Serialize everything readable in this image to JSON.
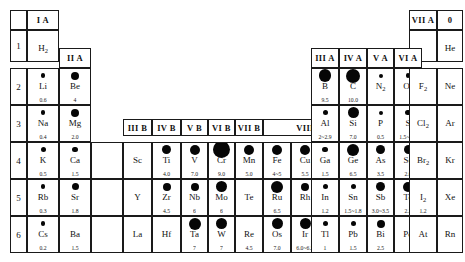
{
  "group_headers": [
    {
      "label": "I A",
      "x": 27,
      "y": 10,
      "w": 32,
      "h": 20
    },
    {
      "label": "II A",
      "x": 59,
      "y": 48,
      "w": 32,
      "h": 20
    },
    {
      "label": "III B",
      "x": 123,
      "y": 119,
      "w": 29,
      "h": 17
    },
    {
      "label": "IV B",
      "x": 152,
      "y": 119,
      "w": 29,
      "h": 17
    },
    {
      "label": "V B",
      "x": 181,
      "y": 119,
      "w": 27,
      "h": 17
    },
    {
      "label": "VI B",
      "x": 208,
      "y": 119,
      "w": 27,
      "h": 17
    },
    {
      "label": "VII B",
      "x": 235,
      "y": 119,
      "w": 28,
      "h": 17
    },
    {
      "label": "VIII",
      "x": 263,
      "y": 119,
      "w": 84,
      "h": 17
    },
    {
      "label": "I B",
      "x": 347,
      "y": 119,
      "w": 25,
      "h": 17
    },
    {
      "label": "II B",
      "x": 372,
      "y": 119,
      "w": 26,
      "h": 17
    },
    {
      "label": "III A",
      "x": 311,
      "y": 48,
      "w": 28,
      "h": 20
    },
    {
      "label": "IV A",
      "x": 339,
      "y": 48,
      "w": 28,
      "h": 20
    },
    {
      "label": "V A",
      "x": 367,
      "y": 48,
      "w": 27,
      "h": 20
    },
    {
      "label": "VI A",
      "x": 394,
      "y": 48,
      "w": 28,
      "h": 20
    },
    {
      "label": "VII A",
      "x": 409,
      "y": 10,
      "w": 28,
      "h": 20
    },
    {
      "label": "0",
      "x": 437,
      "y": 10,
      "w": 26,
      "h": 20
    }
  ],
  "period_labels": [
    {
      "label": "1",
      "x": 10,
      "y": 30,
      "w": 17,
      "h": 32
    },
    {
      "label": "2",
      "x": 10,
      "y": 68,
      "w": 17,
      "h": 37
    },
    {
      "label": "3",
      "x": 10,
      "y": 105,
      "w": 17,
      "h": 37
    },
    {
      "label": "4",
      "x": 10,
      "y": 142,
      "w": 17,
      "h": 37
    },
    {
      "label": "5",
      "x": 10,
      "y": 179,
      "w": 17,
      "h": 37
    },
    {
      "label": "6",
      "x": 10,
      "y": 216,
      "w": 17,
      "h": 37
    }
  ],
  "elements": [
    {
      "symbol": "H",
      "sub": "2",
      "value": "",
      "dot": 0,
      "x": 27,
      "y": 30,
      "w": 32,
      "h": 32
    },
    {
      "symbol": "He",
      "sub": "",
      "value": "",
      "dot": 0,
      "x": 437,
      "y": 30,
      "w": 26,
      "h": 32
    },
    {
      "symbol": "Li",
      "sub": "",
      "value": "0.6",
      "dot": 4.5,
      "x": 27,
      "y": 68,
      "w": 32,
      "h": 37
    },
    {
      "symbol": "Be",
      "sub": "",
      "value": "4",
      "dot": 8,
      "x": 59,
      "y": 68,
      "w": 32,
      "h": 37
    },
    {
      "symbol": "B",
      "sub": "",
      "value": "9.5",
      "dot": 12.5,
      "x": 311,
      "y": 68,
      "w": 28,
      "h": 37
    },
    {
      "symbol": "C",
      "sub": "",
      "value": "10.0",
      "dot": 14,
      "x": 339,
      "y": 68,
      "w": 28,
      "h": 37
    },
    {
      "symbol": "N",
      "sub": "2",
      "value": "",
      "dot": 4,
      "x": 367,
      "y": 68,
      "w": 27,
      "h": 37
    },
    {
      "symbol": "O",
      "sub": "2",
      "value": "",
      "dot": 4.5,
      "x": 394,
      "y": 68,
      "w": 28,
      "h": 37
    },
    {
      "symbol": "F",
      "sub": "2",
      "value": "",
      "dot": 0,
      "x": 409,
      "y": 68,
      "w": 28,
      "h": 37
    },
    {
      "symbol": "Ne",
      "sub": "",
      "value": "",
      "dot": 0,
      "x": 437,
      "y": 68,
      "w": 26,
      "h": 37
    },
    {
      "symbol": "Na",
      "sub": "",
      "value": "0.4",
      "dot": 4.5,
      "x": 27,
      "y": 105,
      "w": 32,
      "h": 37
    },
    {
      "symbol": "Mg",
      "sub": "",
      "value": "2.0",
      "dot": 8,
      "x": 59,
      "y": 105,
      "w": 32,
      "h": 37
    },
    {
      "symbol": "Al",
      "sub": "",
      "value": "2~2.9",
      "dot": 5,
      "x": 311,
      "y": 105,
      "w": 28,
      "h": 37
    },
    {
      "symbol": "Si",
      "sub": "",
      "value": "7.0",
      "dot": 11,
      "x": 339,
      "y": 105,
      "w": 28,
      "h": 37
    },
    {
      "symbol": "P",
      "sub": "",
      "value": "0.5",
      "dot": 4,
      "x": 367,
      "y": 105,
      "w": 27,
      "h": 37
    },
    {
      "symbol": "S",
      "sub": "",
      "value": "1.5~2.5",
      "dot": 5.5,
      "x": 394,
      "y": 105,
      "w": 28,
      "h": 37
    },
    {
      "symbol": "Cl",
      "sub": "2",
      "value": "",
      "dot": 0,
      "x": 409,
      "y": 105,
      "w": 28,
      "h": 37
    },
    {
      "symbol": "Ar",
      "sub": "",
      "value": "",
      "dot": 0,
      "x": 437,
      "y": 105,
      "w": 26,
      "h": 37
    },
    {
      "symbol": "K",
      "sub": "",
      "value": "0.5",
      "dot": 5,
      "x": 27,
      "y": 142,
      "w": 32,
      "h": 37
    },
    {
      "symbol": "Ca",
      "sub": "",
      "value": "1.5",
      "dot": 5.5,
      "x": 59,
      "y": 142,
      "w": 32,
      "h": 37
    },
    {
      "symbol": "Sc",
      "sub": "",
      "value": "",
      "dot": 0,
      "x": 123,
      "y": 142,
      "w": 29,
      "h": 37
    },
    {
      "symbol": "Ti",
      "sub": "",
      "value": "4.0",
      "dot": 9,
      "x": 152,
      "y": 142,
      "w": 29,
      "h": 37
    },
    {
      "symbol": "V",
      "sub": "",
      "value": "7.0",
      "dot": 10,
      "x": 181,
      "y": 142,
      "w": 27,
      "h": 37
    },
    {
      "symbol": "Cr",
      "sub": "",
      "value": "9.0",
      "dot": 17,
      "x": 208,
      "y": 142,
      "w": 27,
      "h": 37
    },
    {
      "symbol": "Mn",
      "sub": "",
      "value": "5.0",
      "dot": 10,
      "x": 235,
      "y": 142,
      "w": 28,
      "h": 37
    },
    {
      "symbol": "Fe",
      "sub": "",
      "value": "4~5",
      "dot": 10,
      "x": 263,
      "y": 142,
      "w": 28,
      "h": 37
    },
    {
      "symbol": "Cu",
      "sub": "",
      "value": "5.5",
      "dot": 10,
      "x": 291,
      "y": 142,
      "w": 28,
      "h": 37
    },
    {
      "symbol": "Ni",
      "sub": "",
      "value": "3",
      "dot": 8,
      "x": 319,
      "y": 142,
      "w": 28,
      "h": 37
    },
    {
      "symbol": "Co",
      "sub": "",
      "value": "2.5~3",
      "dot": 8.5,
      "x": 347,
      "y": 142,
      "w": 25,
      "h": 37
    },
    {
      "symbol": "Zn",
      "sub": "",
      "value": "2.5",
      "dot": 6,
      "x": 372,
      "y": 142,
      "w": 26,
      "h": 37
    },
    {
      "symbol": "Ga",
      "sub": "",
      "value": "1.5",
      "dot": 5.5,
      "x": 311,
      "y": 142,
      "w": 28,
      "h": 37
    },
    {
      "symbol": "Ge",
      "sub": "",
      "value": "6.5",
      "dot": 12,
      "x": 339,
      "y": 142,
      "w": 28,
      "h": 37
    },
    {
      "symbol": "As",
      "sub": "",
      "value": "3.5",
      "dot": 9,
      "x": 367,
      "y": 142,
      "w": 27,
      "h": 37
    },
    {
      "symbol": "Se",
      "sub": "",
      "value": "2.0",
      "dot": 9,
      "x": 394,
      "y": 142,
      "w": 28,
      "h": 37
    },
    {
      "symbol": "Br",
      "sub": "2",
      "value": "",
      "dot": 0,
      "x": 409,
      "y": 142,
      "w": 28,
      "h": 37
    },
    {
      "symbol": "Kr",
      "sub": "",
      "value": "",
      "dot": 0,
      "x": 437,
      "y": 142,
      "w": 26,
      "h": 37
    },
    {
      "symbol": "Rb",
      "sub": "",
      "value": "0.3",
      "dot": 4.5,
      "x": 27,
      "y": 179,
      "w": 32,
      "h": 37
    },
    {
      "symbol": "Sr",
      "sub": "",
      "value": "1.8",
      "dot": 7,
      "x": 59,
      "y": 179,
      "w": 32,
      "h": 37
    },
    {
      "symbol": "Y",
      "sub": "",
      "value": "",
      "dot": 0,
      "x": 123,
      "y": 179,
      "w": 29,
      "h": 37
    },
    {
      "symbol": "Zr",
      "sub": "",
      "value": "4.5",
      "dot": 8,
      "x": 152,
      "y": 179,
      "w": 29,
      "h": 37
    },
    {
      "symbol": "Nb",
      "sub": "",
      "value": "6",
      "dot": 8,
      "x": 181,
      "y": 179,
      "w": 27,
      "h": 37
    },
    {
      "symbol": "Mo",
      "sub": "",
      "value": "6",
      "dot": 11,
      "x": 208,
      "y": 179,
      "w": 27,
      "h": 37
    },
    {
      "symbol": "Te",
      "sub": "",
      "value": "",
      "dot": 0,
      "x": 235,
      "y": 179,
      "w": 28,
      "h": 37
    },
    {
      "symbol": "Ru",
      "sub": "",
      "value": "6.5",
      "dot": 12,
      "x": 263,
      "y": 179,
      "w": 28,
      "h": 37
    },
    {
      "symbol": "Rh",
      "sub": "",
      "value": "",
      "dot": 8,
      "x": 291,
      "y": 179,
      "w": 28,
      "h": 37
    },
    {
      "symbol": "Pd",
      "sub": "",
      "value": "4.8",
      "dot": 9,
      "x": 319,
      "y": 179,
      "w": 28,
      "h": 37
    },
    {
      "symbol": "Ag",
      "sub": "",
      "value": "2.5~4",
      "dot": 10,
      "x": 347,
      "y": 179,
      "w": 25,
      "h": 37
    },
    {
      "symbol": "Cd",
      "sub": "",
      "value": "2.0",
      "dot": 5,
      "x": 372,
      "y": 179,
      "w": 26,
      "h": 37
    },
    {
      "symbol": "In",
      "sub": "",
      "value": "1.2",
      "dot": 5,
      "x": 311,
      "y": 179,
      "w": 28,
      "h": 37
    },
    {
      "symbol": "Sn",
      "sub": "",
      "value": "1.5~1.8",
      "dot": 5,
      "x": 339,
      "y": 179,
      "w": 28,
      "h": 37
    },
    {
      "symbol": "Sb",
      "sub": "",
      "value": "3.0~3.5",
      "dot": 9,
      "x": 367,
      "y": 179,
      "w": 27,
      "h": 37
    },
    {
      "symbol": "Te",
      "sub": "",
      "value": "2.3",
      "dot": 10,
      "x": 394,
      "y": 179,
      "w": 28,
      "h": 37
    },
    {
      "symbol": "I",
      "sub": "2",
      "value": "1.2",
      "dot": 0,
      "x": 409,
      "y": 179,
      "w": 28,
      "h": 37
    },
    {
      "symbol": "Xe",
      "sub": "",
      "value": "",
      "dot": 0,
      "x": 437,
      "y": 179,
      "w": 26,
      "h": 37
    },
    {
      "symbol": "Cs",
      "sub": "",
      "value": "0.2",
      "dot": 4.5,
      "x": 27,
      "y": 216,
      "w": 32,
      "h": 37
    },
    {
      "symbol": "Ba",
      "sub": "",
      "value": "1.5",
      "dot": 0,
      "x": 59,
      "y": 216,
      "w": 32,
      "h": 37
    },
    {
      "symbol": "La",
      "sub": "",
      "value": "",
      "dot": 0,
      "x": 123,
      "y": 216,
      "w": 29,
      "h": 37
    },
    {
      "symbol": "Hf",
      "sub": "",
      "value": "",
      "dot": 0,
      "x": 152,
      "y": 216,
      "w": 29,
      "h": 37
    },
    {
      "symbol": "Ta",
      "sub": "",
      "value": "7",
      "dot": 12,
      "x": 181,
      "y": 216,
      "w": 27,
      "h": 37
    },
    {
      "symbol": "W",
      "sub": "",
      "value": "7",
      "dot": 11,
      "x": 208,
      "y": 216,
      "w": 27,
      "h": 37
    },
    {
      "symbol": "Re",
      "sub": "",
      "value": "4.5",
      "dot": 0,
      "x": 235,
      "y": 216,
      "w": 28,
      "h": 37
    },
    {
      "symbol": "Os",
      "sub": "",
      "value": "7.0",
      "dot": 11,
      "x": 263,
      "y": 216,
      "w": 28,
      "h": 37
    },
    {
      "symbol": "Ir",
      "sub": "",
      "value": "6.0~6.5",
      "dot": 11,
      "x": 291,
      "y": 216,
      "w": 28,
      "h": 37
    },
    {
      "symbol": "Pt",
      "sub": "",
      "value": "4.3",
      "dot": 10,
      "x": 319,
      "y": 216,
      "w": 28,
      "h": 37
    },
    {
      "symbol": "Au",
      "sub": "",
      "value": "2.5~3",
      "dot": 5.5,
      "x": 347,
      "y": 216,
      "w": 25,
      "h": 37
    },
    {
      "symbol": "Hg",
      "sub": "",
      "value": "",
      "dot": 0,
      "x": 372,
      "y": 216,
      "w": 26,
      "h": 37
    },
    {
      "symbol": "Tl",
      "sub": "",
      "value": "1",
      "dot": 5,
      "x": 311,
      "y": 216,
      "w": 28,
      "h": 37
    },
    {
      "symbol": "Pb",
      "sub": "",
      "value": "1.5",
      "dot": 5,
      "x": 339,
      "y": 216,
      "w": 28,
      "h": 37
    },
    {
      "symbol": "Bi",
      "sub": "",
      "value": "2.5",
      "dot": 8,
      "x": 367,
      "y": 216,
      "w": 27,
      "h": 37
    },
    {
      "symbol": "Po",
      "sub": "",
      "value": "",
      "dot": 0,
      "x": 394,
      "y": 216,
      "w": 28,
      "h": 37
    },
    {
      "symbol": "At",
      "sub": "",
      "value": "",
      "dot": 0,
      "x": 409,
      "y": 216,
      "w": 28,
      "h": 37
    },
    {
      "symbol": "Rn",
      "sub": "",
      "value": "",
      "dot": 0,
      "x": 437,
      "y": 216,
      "w": 26,
      "h": 37
    }
  ],
  "blank_cells": [
    {
      "x": 10,
      "y": 10,
      "w": 17,
      "h": 20
    },
    {
      "x": 59,
      "y": 105,
      "w": 0,
      "h": 0
    },
    {
      "x": 91,
      "y": 142,
      "w": 32,
      "h": 37
    },
    {
      "x": 91,
      "y": 179,
      "w": 32,
      "h": 37
    },
    {
      "x": 91,
      "y": 216,
      "w": 32,
      "h": 37
    },
    {
      "x": 409,
      "y": 30,
      "w": 28,
      "h": 32
    }
  ],
  "chart_data": {
    "type": "table",
    "note": "Each element cell shows a filled circle whose diameter encodes a magnitude, plus a printed numeric value beneath the symbol."
  }
}
